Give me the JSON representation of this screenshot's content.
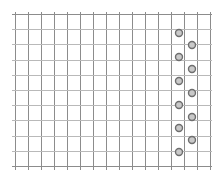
{
  "figure": {
    "background_color": "#ffffff",
    "grid_color": "#8c8c8c",
    "grid_color_light": "#b9b9b9",
    "marker_color": "#6e6e6e",
    "marker_fill": "#c9c9c9",
    "width": 221,
    "height": 179
  },
  "chart_data": {
    "type": "scatter",
    "title": "",
    "subtitle": "",
    "xlabel": "",
    "ylabel": "",
    "grid": true,
    "grid_minor": false,
    "legend": null,
    "legend_position": "none",
    "annotations": [],
    "xticklabels": [],
    "yticklabels": [],
    "xlim": [
      0,
      15
    ],
    "ylim": [
      0,
      10
    ],
    "axis_visible": false,
    "grid_geometry": {
      "x_start": 15,
      "x_end": 210,
      "y_start": 14,
      "y_end": 166,
      "x_spacing": 13,
      "y_spacing": 15.2,
      "n_vertical_lines": 16,
      "n_horizontal_lines": 11
    },
    "marker": {
      "shape": "circle-open",
      "size": 5,
      "edge_width": 1.4
    },
    "series": [
      {
        "name": "series-1",
        "x": [
          12.6,
          13.6,
          12.6,
          13.6,
          12.6,
          13.6,
          12.6,
          13.6,
          12.6,
          13.6,
          12.6
        ],
        "y": [
          9.1,
          8.6,
          8.1,
          7.6,
          7.1,
          6.6,
          6.1,
          5.6,
          5.1,
          4.6,
          4.1
        ],
        "points_px": [
          {
            "cx": 179,
            "cy": 33
          },
          {
            "cx": 192,
            "cy": 45
          },
          {
            "cx": 179,
            "cy": 57
          },
          {
            "cx": 192,
            "cy": 69
          },
          {
            "cx": 179,
            "cy": 81
          },
          {
            "cx": 192,
            "cy": 93
          },
          {
            "cx": 179,
            "cy": 105
          },
          {
            "cx": 192,
            "cy": 117
          },
          {
            "cx": 179,
            "cy": 128
          },
          {
            "cx": 192,
            "cy": 140
          },
          {
            "cx": 179,
            "cy": 152
          }
        ]
      }
    ]
  }
}
